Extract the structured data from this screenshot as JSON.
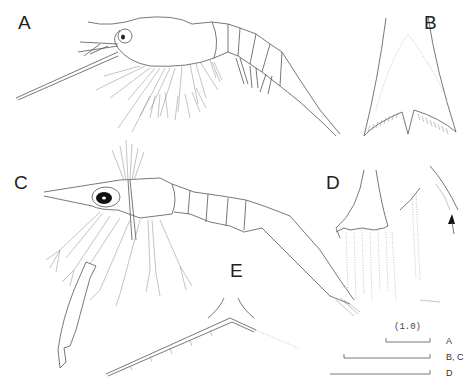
{
  "figure": {
    "panels": [
      {
        "id": "A",
        "label": "A",
        "subject": "larva lateral view"
      },
      {
        "id": "B",
        "label": "B",
        "subject": "telson dorsal view"
      },
      {
        "id": "C",
        "label": "C",
        "subject": "larva lateral view"
      },
      {
        "id": "D",
        "label": "D",
        "subject": "telson and seta detail"
      },
      {
        "id": "E",
        "label": "E",
        "subject": "spine detail"
      }
    ],
    "scale_bars": {
      "note": "(1.0)",
      "bars": [
        {
          "label": "A"
        },
        {
          "label": "B, C"
        },
        {
          "label": "D"
        }
      ]
    },
    "arrow": "arrow-icon"
  }
}
